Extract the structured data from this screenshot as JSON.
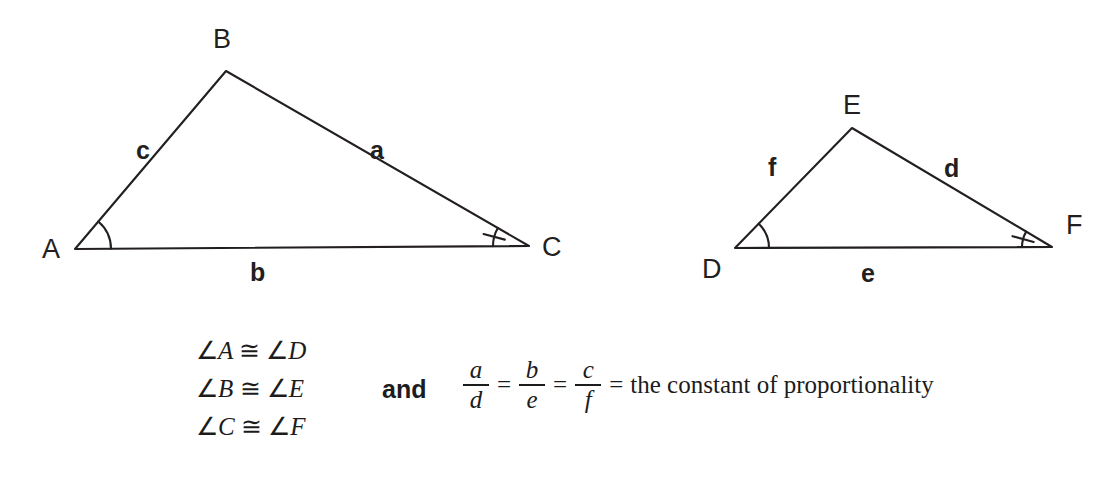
{
  "figure": {
    "stroke_color": "#231f20",
    "text_color": "#1c1c1c",
    "background": "#ffffff"
  },
  "triangle_left": {
    "name": "triangle-abc",
    "vertices": [
      {
        "id": "A",
        "label": "A",
        "x": 75,
        "y": 249,
        "label_x": 42,
        "label_y": 258
      },
      {
        "id": "B",
        "label": "B",
        "x": 226,
        "y": 71,
        "label_x": 213,
        "label_y": 48
      },
      {
        "id": "C",
        "label": "C",
        "x": 529,
        "y": 246,
        "label_x": 542,
        "label_y": 256
      }
    ],
    "sides": [
      {
        "id": "c",
        "label": "c",
        "from": "A",
        "to": "B",
        "label_x": 136,
        "label_y": 159
      },
      {
        "id": "a",
        "label": "a",
        "from": "B",
        "to": "C",
        "label_x": 370,
        "label_y": 159
      },
      {
        "id": "b",
        "label": "b",
        "from": "A",
        "to": "C",
        "label_x": 250,
        "label_y": 281
      }
    ],
    "marked_angles": [
      {
        "at": "A",
        "marks": 0,
        "radius": 36
      },
      {
        "at": "C",
        "marks": 1,
        "radius": 36
      }
    ]
  },
  "triangle_right": {
    "name": "triangle-def",
    "vertices": [
      {
        "id": "D",
        "label": "D",
        "x": 735,
        "y": 248,
        "label_x": 702,
        "label_y": 278
      },
      {
        "id": "E",
        "label": "E",
        "x": 852,
        "y": 128,
        "label_x": 843,
        "label_y": 114
      },
      {
        "id": "F",
        "label": "F",
        "x": 1052,
        "y": 247,
        "label_x": 1066,
        "label_y": 234
      }
    ],
    "sides": [
      {
        "id": "f",
        "label": "f",
        "from": "D",
        "to": "E",
        "label_x": 768,
        "label_y": 176
      },
      {
        "id": "d",
        "label": "d",
        "from": "E",
        "to": "F",
        "label_x": 944,
        "label_y": 177
      },
      {
        "id": "e",
        "label": "e",
        "from": "D",
        "to": "F",
        "label_x": 861,
        "label_y": 282
      }
    ],
    "marked_angles": [
      {
        "at": "D",
        "marks": 0,
        "radius": 34
      },
      {
        "at": "F",
        "marks": 1,
        "radius": 30
      }
    ]
  },
  "statements": {
    "angle_congruences": [
      {
        "left": "A",
        "right": "D",
        "angle_symbol": "∠",
        "congruent_symbol": "≅"
      },
      {
        "left": "B",
        "right": "E",
        "angle_symbol": "∠",
        "congruent_symbol": "≅"
      },
      {
        "left": "C",
        "right": "F",
        "angle_symbol": "∠",
        "congruent_symbol": "≅"
      }
    ],
    "conjunction": "and",
    "proportion": {
      "fractions": [
        {
          "numerator": "a",
          "denominator": "d"
        },
        {
          "numerator": "b",
          "denominator": "e"
        },
        {
          "numerator": "c",
          "denominator": "f"
        }
      ],
      "equals": "=",
      "result_text": "the constant of proportionality"
    }
  }
}
